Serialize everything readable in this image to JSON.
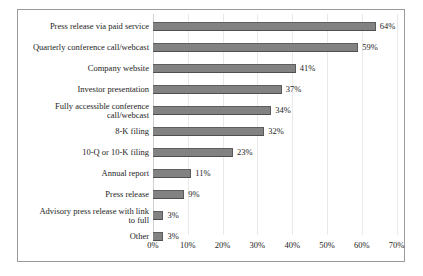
{
  "chart_data": {
    "type": "bar",
    "orientation": "horizontal",
    "title": "",
    "xlabel": "",
    "ylabel": "",
    "xlim": [
      0,
      70
    ],
    "xtick_labels": [
      "0%",
      "10%",
      "20%",
      "30%",
      "40%",
      "50%",
      "60%",
      "70%"
    ],
    "xtick_values": [
      0,
      10,
      20,
      30,
      40,
      50,
      60,
      70
    ],
    "grid": true,
    "legend": false,
    "bar_color": "#828282",
    "categories": [
      "Press release via paid service",
      "Quarterly conference call/webcast",
      "Company website",
      "Investor presentation",
      "Fully accessible conference\ncall/webcast",
      "8-K filing",
      "10-Q or 10-K filing",
      "Annual report",
      "Press release",
      "Advisory press release with link\nto full",
      "Other"
    ],
    "values": [
      64,
      59,
      41,
      37,
      34,
      32,
      23,
      11,
      9,
      3,
      3
    ],
    "value_labels": [
      "64%",
      "59%",
      "41%",
      "37%",
      "34%",
      "32%",
      "23%",
      "11%",
      "9%",
      "3%",
      "3%"
    ]
  }
}
